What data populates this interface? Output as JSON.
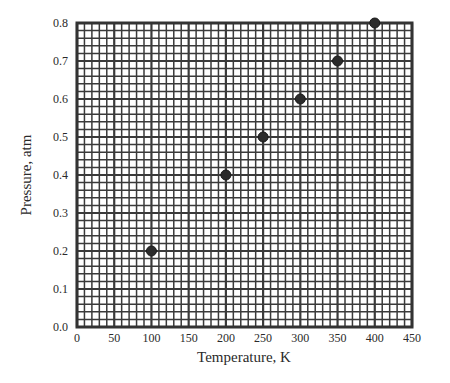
{
  "chart_data": {
    "type": "scatter",
    "title": "",
    "xlabel": "Temperature, K",
    "ylabel": "Pressure, atm",
    "xlim": [
      0,
      450
    ],
    "ylim": [
      0.0,
      0.8
    ],
    "x_ticks": [
      "0",
      "50",
      "100",
      "150",
      "200",
      "250",
      "300",
      "350",
      "400",
      "450"
    ],
    "y_ticks": [
      "0.0",
      "0.1",
      "0.2",
      "0.3",
      "0.4",
      "0.5",
      "0.6",
      "0.7",
      "0.8"
    ],
    "grid": true,
    "grid_minor_divisions": 5,
    "legend": null,
    "series": [
      {
        "name": "data",
        "x": [
          100,
          200,
          250,
          300,
          350,
          400
        ],
        "y": [
          0.2,
          0.4,
          0.5,
          0.6,
          0.7,
          0.8
        ],
        "marker": "circle",
        "color": "#2b2b2b"
      }
    ]
  },
  "style": {
    "grid_color": "#3a3a3a",
    "frame_color": "#333333",
    "background": "#ffffff"
  }
}
